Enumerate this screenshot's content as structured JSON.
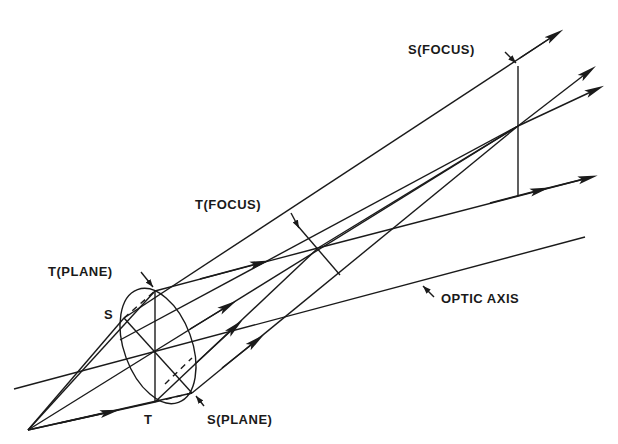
{
  "diagram": {
    "type": "astigmatism ray diagram",
    "labels": {
      "s_focus": "S(FOCUS)",
      "t_focus": "T(FOCUS)",
      "t_plane": "T(PLANE)",
      "s_plane": "S(PLANE)",
      "s_point": "S",
      "t_point": "T",
      "optic_axis": "OPTIC AXIS"
    },
    "colors": {
      "line": "#1a1a1a",
      "background": "#ffffff"
    }
  }
}
